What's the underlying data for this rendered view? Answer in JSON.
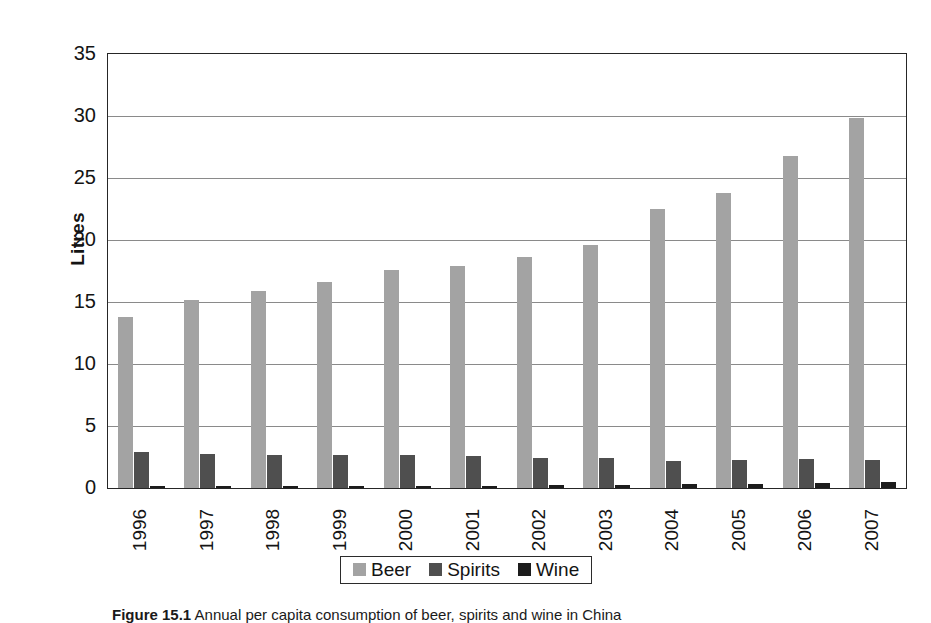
{
  "figure": {
    "caption_label": "Figure 15.1",
    "caption_text": "  Annual per capita consumption of beer, spirits and wine in China"
  },
  "chart_data": {
    "type": "bar",
    "title": "",
    "subtitle": "",
    "xlabel": "",
    "ylabel": "Litres",
    "ylim": [
      0,
      35
    ],
    "yticks": [
      0,
      5,
      10,
      15,
      20,
      25,
      30,
      35
    ],
    "ytick_labels": [
      "0",
      "5",
      "10",
      "15",
      "20",
      "25",
      "30",
      "35"
    ],
    "grid": true,
    "legend_position": "bottom",
    "categories": [
      "1996",
      "1997",
      "1998",
      "1999",
      "2000",
      "2001",
      "2002",
      "2003",
      "2004",
      "2005",
      "2006",
      "2007"
    ],
    "series": [
      {
        "name": "Beer",
        "color": "#a3a3a3",
        "values": [
          13.8,
          15.2,
          15.9,
          16.6,
          17.6,
          17.9,
          18.6,
          19.6,
          22.5,
          23.8,
          26.8,
          29.8
        ]
      },
      {
        "name": "Spirits",
        "color": "#4f4f4f",
        "values": [
          2.9,
          2.75,
          2.65,
          2.65,
          2.7,
          2.6,
          2.4,
          2.4,
          2.2,
          2.25,
          2.3,
          2.25
        ]
      },
      {
        "name": "Wine",
        "color": "#1c1c1c",
        "values": [
          0.15,
          0.18,
          0.2,
          0.2,
          0.2,
          0.2,
          0.25,
          0.28,
          0.3,
          0.35,
          0.4,
          0.45
        ]
      }
    ]
  },
  "legend": {
    "entries": [
      {
        "label": "Beer",
        "swatch": "beer"
      },
      {
        "label": "Spirits",
        "swatch": "spirits"
      },
      {
        "label": "Wine",
        "swatch": "wine"
      }
    ]
  }
}
